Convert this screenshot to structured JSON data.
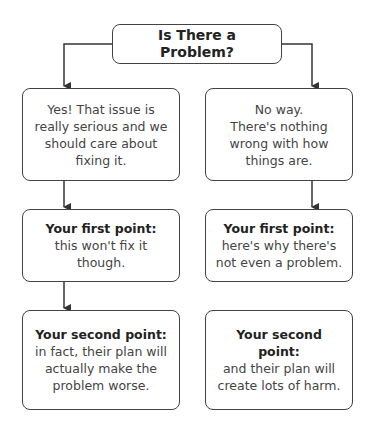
{
  "title": "Is There a Problem?",
  "left": {
    "answer": "Yes! That issue is really serious and we should care about fixing it.",
    "first": {
      "label": "Your first point:",
      "text": "this won't fix it though."
    },
    "second": {
      "label": "Your second point:",
      "text": "in fact, their plan will actually make the problem worse."
    }
  },
  "right": {
    "answer_line1": "No way.",
    "answer_line2": "There's nothing wrong with how things are.",
    "first": {
      "label": "Your first point:",
      "text": " here's why there's not even a problem."
    },
    "second": {
      "label": "Your second point:",
      "text": "and their plan will create lots of harm."
    }
  }
}
